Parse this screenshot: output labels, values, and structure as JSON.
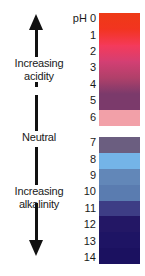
{
  "diagram": {
    "unit_label": "pH",
    "annotations": {
      "increasing_acidity": "Increasing\nacidity",
      "increasing_acidity_line1": "Increasing",
      "increasing_acidity_line2": "acidity",
      "neutral": "Neutral",
      "increasing_alkalinity_line1": "Increasing",
      "increasing_alkalinity_line2": "alkalinity"
    },
    "arrows": [
      {
        "name": "up-arrow",
        "direction": "up",
        "meaning": "Increasing acidity"
      },
      {
        "name": "down-arrow",
        "direction": "down",
        "meaning": "Increasing alkalinity"
      }
    ]
  },
  "chart_data": {
    "type": "heatmap",
    "ylabel": "pH",
    "ylim": [
      0,
      14
    ],
    "grid": false,
    "legend": "none",
    "orientation": "vertical",
    "categories": [
      "0",
      "1",
      "2",
      "3",
      "4",
      "5",
      "6",
      "7",
      "8",
      "9",
      "10",
      "11",
      "12",
      "13",
      "14"
    ],
    "values": [
      0,
      1,
      2,
      3,
      4,
      5,
      6,
      7,
      8,
      9,
      10,
      11,
      12,
      13,
      14
    ],
    "segments": [
      {
        "ph": "0",
        "label": "0",
        "color": "#ee3a16",
        "region": "acidic"
      },
      {
        "ph": "1",
        "label": "1",
        "color": "#f23420",
        "region": "acidic"
      },
      {
        "ph": "2",
        "label": "2",
        "color": "#f53a5a",
        "region": "acidic"
      },
      {
        "ph": "3",
        "label": "3",
        "color": "#d43f73",
        "region": "acidic"
      },
      {
        "ph": "4",
        "label": "4",
        "color": "#b0406a",
        "region": "acidic"
      },
      {
        "ph": "5",
        "label": "5",
        "color": "#7b3a6b",
        "region": "acidic"
      },
      {
        "ph": "6",
        "label": "6",
        "color": "#f2a0a8",
        "region": "acidic"
      },
      {
        "ph": "7",
        "label": "7",
        "color": "#6b5e80",
        "region": "alkaline"
      },
      {
        "ph": "8",
        "label": "8",
        "color": "#74b4e8",
        "region": "alkaline"
      },
      {
        "ph": "9",
        "label": "9",
        "color": "#6287b8",
        "region": "alkaline"
      },
      {
        "ph": "10",
        "label": "10",
        "color": "#5a7cb0",
        "region": "alkaline"
      },
      {
        "ph": "11",
        "label": "11",
        "color": "#3d3d85",
        "region": "alkaline"
      },
      {
        "ph": "12",
        "label": "12",
        "color": "#231765",
        "region": "alkaline"
      },
      {
        "ph": "13",
        "label": "13",
        "color": "#1e1464",
        "region": "alkaline"
      },
      {
        "ph": "14",
        "label": "14",
        "color": "#1b1160",
        "region": "alkaline"
      }
    ],
    "colors": {
      "acid_top": "#ee3a16",
      "acid_mid": "#f53a5a",
      "acid_low": "#7b3a6b",
      "neutral_band": "#f2a0a8",
      "alkali_top": "#6b5e80",
      "alkali_sky": "#74b4e8",
      "alkali_deep": "#1b1160",
      "arrow": "#111111",
      "text": "#1a1a1a",
      "background": "#ffffff"
    }
  }
}
